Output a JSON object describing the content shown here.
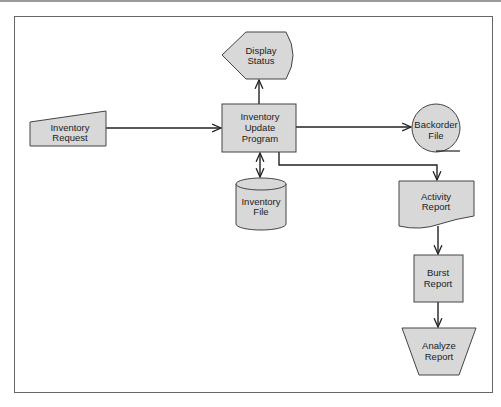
{
  "diagram": {
    "type": "system flowchart",
    "nodes": [
      {
        "id": "display_status",
        "shape": "display",
        "lines": [
          "Display",
          "Status"
        ]
      },
      {
        "id": "inventory_request",
        "shape": "manual-input",
        "lines": [
          "Inventory",
          "Request"
        ]
      },
      {
        "id": "inventory_update_program",
        "shape": "process",
        "lines": [
          "Inventory",
          "Update",
          "Program"
        ]
      },
      {
        "id": "backorder_file",
        "shape": "magnetic-tape",
        "lines": [
          "Backorder",
          "File"
        ]
      },
      {
        "id": "inventory_file",
        "shape": "disk-storage",
        "lines": [
          "Inventory",
          "File"
        ]
      },
      {
        "id": "activity_report",
        "shape": "document",
        "lines": [
          "Activity",
          "Report"
        ]
      },
      {
        "id": "burst_report",
        "shape": "process",
        "lines": [
          "Burst",
          "Report"
        ]
      },
      {
        "id": "analyze_report",
        "shape": "manual-operation",
        "lines": [
          "Analyze",
          "Report"
        ]
      }
    ],
    "edges": [
      {
        "from": "inventory_request",
        "to": "inventory_update_program"
      },
      {
        "from": "inventory_update_program",
        "to": "display_status"
      },
      {
        "from": "inventory_update_program",
        "to": "backorder_file"
      },
      {
        "from": "inventory_update_program",
        "to": "inventory_file",
        "bidirectional": true
      },
      {
        "from": "inventory_update_program",
        "to": "activity_report"
      },
      {
        "from": "activity_report",
        "to": "burst_report"
      },
      {
        "from": "burst_report",
        "to": "analyze_report"
      }
    ]
  }
}
